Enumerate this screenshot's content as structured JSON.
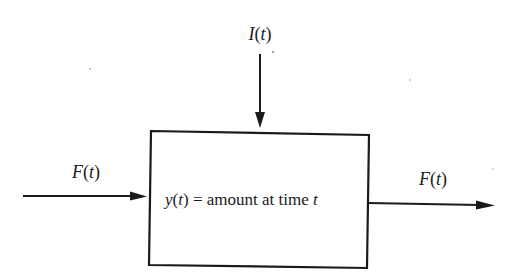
{
  "diagram": {
    "type": "compartment-flow",
    "compartment": {
      "label_var": "y",
      "label_arg": "t",
      "label_eq": " = amount at time ",
      "label_tail": "t"
    },
    "inflow_left": {
      "label_var": "F",
      "label_arg": "t"
    },
    "inflow_top": {
      "label_var": "I",
      "label_arg": "t"
    },
    "outflow_right": {
      "label_var": "F",
      "label_arg": "t"
    }
  }
}
